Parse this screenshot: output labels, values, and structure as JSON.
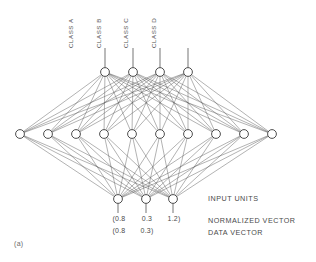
{
  "figure": {
    "label": "(a)",
    "background": "#ffffff",
    "ink": "#3a3a3a"
  },
  "class_labels": [
    {
      "text": "CLASS A",
      "x": 105
    },
    {
      "text": "CLASS B",
      "x": 133
    },
    {
      "text": "CLASS C",
      "x": 160
    },
    {
      "text": "CLASS D",
      "x": 188
    }
  ],
  "annotations": {
    "input_units": "INPUT UNITS",
    "normalized_vector": "NORMALIZED VECTOR",
    "data_vector": "DATA VECTOR"
  },
  "vectors": {
    "normalized": [
      "(0.8",
      "0.3",
      "1.2)"
    ],
    "data": [
      "(0.8",
      "0.3)",
      ""
    ]
  },
  "network": {
    "output_nodes": [
      {
        "id": "class-a",
        "x": 105,
        "y": 72
      },
      {
        "id": "class-b",
        "x": 133,
        "y": 72
      },
      {
        "id": "class-c",
        "x": 160,
        "y": 72
      },
      {
        "id": "class-d",
        "x": 188,
        "y": 72
      }
    ],
    "hidden_nodes": [
      {
        "id": "h1",
        "x": 20,
        "y": 134
      },
      {
        "id": "h2",
        "x": 48,
        "y": 134
      },
      {
        "id": "h3",
        "x": 76,
        "y": 134
      },
      {
        "id": "h4",
        "x": 104,
        "y": 134
      },
      {
        "id": "h5",
        "x": 132,
        "y": 134
      },
      {
        "id": "h6",
        "x": 160,
        "y": 134
      },
      {
        "id": "h7",
        "x": 188,
        "y": 134
      },
      {
        "id": "h8",
        "x": 216,
        "y": 134
      },
      {
        "id": "h9",
        "x": 244,
        "y": 134
      },
      {
        "id": "h10",
        "x": 272,
        "y": 134
      }
    ],
    "input_nodes": [
      {
        "id": "in1",
        "x": 118,
        "y": 199
      },
      {
        "id": "in2",
        "x": 146,
        "y": 199
      },
      {
        "id": "in3",
        "x": 173,
        "y": 199
      }
    ],
    "node_radius": 4.4,
    "output_stem_top": 48,
    "input_stem_bottom": 213,
    "edge_color": "#555555",
    "edge_width": 0.45
  }
}
